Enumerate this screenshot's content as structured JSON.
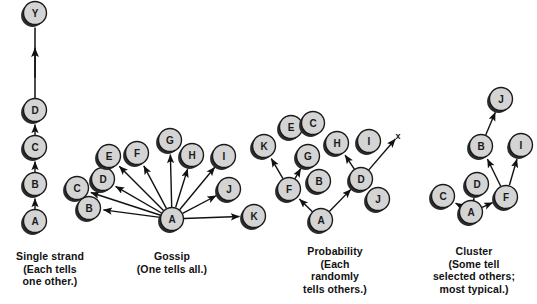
{
  "figure": {
    "background_color": "#ffffff",
    "node_fill": "#d4d4d4",
    "node_stroke": "#1a1a1a",
    "node_shadow": "#2b2b2b",
    "edge_color": "#111111",
    "node_radius": 11.5
  },
  "panels": [
    {
      "id": "single-strand",
      "caption": "Single strand\n(Each tells\none other.)",
      "caption_lines": [
        "Single strand",
        "(Each tells",
        "one other.)"
      ],
      "nodes": [
        {
          "label": "Y",
          "x": 35,
          "y": 13
        },
        {
          "label": "D",
          "x": 35,
          "y": 110
        },
        {
          "label": "C",
          "x": 35,
          "y": 147
        },
        {
          "label": "B",
          "x": 35,
          "y": 184
        },
        {
          "label": "A",
          "x": 35,
          "y": 221
        }
      ],
      "edges": [
        {
          "from": "A",
          "to": "B"
        },
        {
          "from": "B",
          "to": "C"
        },
        {
          "from": "C",
          "to": "D"
        },
        {
          "from": "D",
          "to": "Y",
          "broken": true
        }
      ]
    },
    {
      "id": "gossip",
      "caption": "Gossip\n(One tells all.)",
      "caption_lines": [
        "Gossip",
        "(One tells all.)"
      ],
      "nodes": [
        {
          "label": "A",
          "x": 172,
          "y": 219
        },
        {
          "label": "B",
          "x": 89,
          "y": 208
        },
        {
          "label": "C",
          "x": 77,
          "y": 188
        },
        {
          "label": "D",
          "x": 103,
          "y": 179
        },
        {
          "label": "E",
          "x": 109,
          "y": 156
        },
        {
          "label": "F",
          "x": 137,
          "y": 153
        },
        {
          "label": "G",
          "x": 170,
          "y": 140
        },
        {
          "label": "H",
          "x": 192,
          "y": 155
        },
        {
          "label": "I",
          "x": 224,
          "y": 156
        },
        {
          "label": "J",
          "x": 229,
          "y": 189
        },
        {
          "label": "K",
          "x": 254,
          "y": 216
        }
      ],
      "edges": [
        {
          "from": "A",
          "to": "B"
        },
        {
          "from": "A",
          "to": "C"
        },
        {
          "from": "A",
          "to": "D"
        },
        {
          "from": "A",
          "to": "E"
        },
        {
          "from": "A",
          "to": "F"
        },
        {
          "from": "A",
          "to": "G"
        },
        {
          "from": "A",
          "to": "H"
        },
        {
          "from": "A",
          "to": "I"
        },
        {
          "from": "A",
          "to": "J"
        },
        {
          "from": "A",
          "to": "K"
        }
      ]
    },
    {
      "id": "probability",
      "caption": "Probability\n(Each\nrandomly\ntells others.)",
      "caption_lines": [
        "Probability",
        "(Each",
        "randomly",
        "tells others.)"
      ],
      "x_mark": {
        "label": "x",
        "x": 398,
        "y": 136
      },
      "nodes": [
        {
          "label": "K",
          "x": 264,
          "y": 146
        },
        {
          "label": "E",
          "x": 291,
          "y": 127
        },
        {
          "label": "C",
          "x": 313,
          "y": 123
        },
        {
          "label": "G",
          "x": 308,
          "y": 156
        },
        {
          "label": "H",
          "x": 337,
          "y": 143
        },
        {
          "label": "I",
          "x": 369,
          "y": 141
        },
        {
          "label": "B",
          "x": 319,
          "y": 181
        },
        {
          "label": "F",
          "x": 289,
          "y": 189
        },
        {
          "label": "D",
          "x": 361,
          "y": 179
        },
        {
          "label": "J",
          "x": 378,
          "y": 199
        },
        {
          "label": "A",
          "x": 321,
          "y": 220
        }
      ],
      "edges": [
        {
          "from": "A",
          "to": "F"
        },
        {
          "from": "A",
          "to": "D"
        },
        {
          "from": "F",
          "to": "K"
        },
        {
          "from": "F",
          "to": "G"
        },
        {
          "from": "D",
          "to": "H"
        },
        {
          "from": "D",
          "to": "x_mark"
        }
      ]
    },
    {
      "id": "cluster",
      "caption": "Cluster\n(Some tell\nselected others;\nmost typical.)",
      "caption_lines": [
        "Cluster",
        "(Some tell",
        "selected others;",
        "most typical.)"
      ],
      "nodes": [
        {
          "label": "J",
          "x": 501,
          "y": 99
        },
        {
          "label": "B",
          "x": 481,
          "y": 146
        },
        {
          "label": "I",
          "x": 521,
          "y": 145
        },
        {
          "label": "D",
          "x": 477,
          "y": 184
        },
        {
          "label": "F",
          "x": 506,
          "y": 197
        },
        {
          "label": "C",
          "x": 443,
          "y": 196
        },
        {
          "label": "A",
          "x": 471,
          "y": 212
        }
      ],
      "edges": [
        {
          "from": "A",
          "to": "C"
        },
        {
          "from": "A",
          "to": "D"
        },
        {
          "from": "A",
          "to": "F"
        },
        {
          "from": "F",
          "to": "B"
        },
        {
          "from": "F",
          "to": "I"
        },
        {
          "from": "B",
          "to": "J"
        }
      ]
    }
  ]
}
